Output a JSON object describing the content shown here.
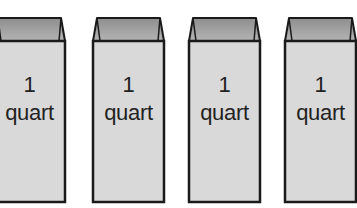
{
  "figure": {
    "colors": {
      "body_fill": "#d9d9d9",
      "top_fill_light": "#b4b4b4",
      "top_fill_dark": "#8e8e8e",
      "outline": "#1a1a1a",
      "text": "#222222",
      "background": "#ffffff"
    },
    "cartons": [
      {
        "number": "1",
        "unit": "quart",
        "x": -7
      },
      {
        "number": "1",
        "unit": "quart",
        "x": 92
      },
      {
        "number": "1",
        "unit": "quart",
        "x": 188
      },
      {
        "number": "1",
        "unit": "quart",
        "x": 284
      }
    ]
  }
}
